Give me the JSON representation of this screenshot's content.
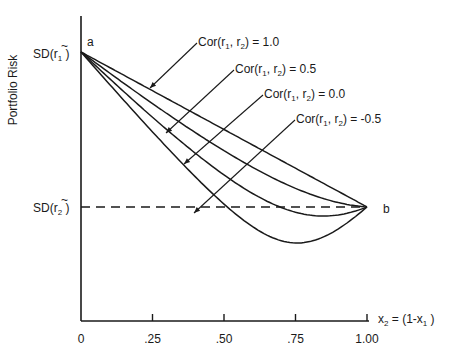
{
  "chart_data": {
    "type": "line",
    "title": "",
    "ylabel": "Portfolio Risk",
    "xlabel": "x2 = (1-x1)",
    "xlabel_parts": {
      "x": "x",
      "sub2": "2",
      "eq": " = (1-x",
      "sub1": "1",
      "close": ")"
    },
    "x_ticks": [
      0,
      0.25,
      0.5,
      0.75,
      1.0
    ],
    "x_tick_labels": [
      "0",
      ".25",
      ".50",
      ".75",
      "1.00"
    ],
    "xlim": [
      0,
      1.0
    ],
    "y_ticks_labels": [
      "SD(r̃1)",
      "SD(r̃2)"
    ],
    "sd1": 1.0,
    "sd2": 0.424,
    "grid": false,
    "point_labels": {
      "a": "a",
      "b": "b"
    },
    "series": [
      {
        "name": "Cor(r̃1, r̃2) = 1.0",
        "corr": 1.0,
        "label_value": "1.0"
      },
      {
        "name": "Cor(r̃1, r̃2) = 0.5",
        "corr": 0.5,
        "label_value": "0.5"
      },
      {
        "name": "Cor(r̃1, r̃2) = 0.0",
        "corr": 0.0,
        "label_value": "0.0"
      },
      {
        "name": "Cor(r̃1, r̃2) = -0.5",
        "corr": -0.5,
        "label_value": "-0.5"
      }
    ],
    "reference_line": {
      "name": "SD(r̃2)",
      "style": "dashed",
      "y": 0.424
    }
  },
  "labels": {
    "ylabel": "Portfolio Risk",
    "a": "a",
    "b": "b",
    "sd": "SD(",
    "r": "r",
    "tilde": "~",
    "close": ")",
    "sub1": "1",
    "sub2": "2",
    "cor_prefix": "Cor(",
    "comma": ", ",
    "eq": ") = "
  }
}
